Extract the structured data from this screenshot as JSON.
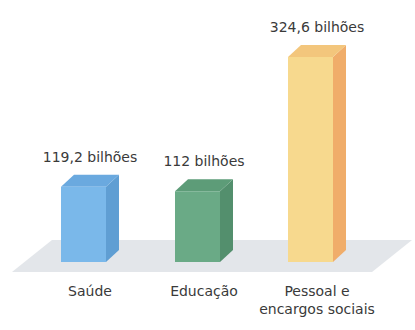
{
  "chart_data": {
    "type": "bar",
    "title": "",
    "categories": [
      "Saúde",
      "Educação",
      "Pessoal e encargos sociais"
    ],
    "category_lines": [
      [
        "Saúde"
      ],
      [
        "Educação"
      ],
      [
        "Pessoal e",
        "encargos sociais"
      ]
    ],
    "values": [
      119.2,
      112,
      324.6
    ],
    "value_labels": [
      "119,2 bilhões",
      "112 bilhões",
      "324,6  bilhões"
    ],
    "unit": "bilhões",
    "xlabel": "",
    "ylabel": "",
    "ylim": [
      0,
      340
    ],
    "grid": false,
    "legend": false,
    "style": "3d",
    "colors": {
      "Saúde": {
        "front": "#7ab8ea",
        "side": "#5f9ed3",
        "top": "#6aa9df"
      },
      "Educação": {
        "front": "#6aaa86",
        "side": "#538f6d",
        "top": "#5d9c78"
      },
      "Pessoal e encargos sociais": {
        "front": "#f7d98e",
        "side": "#f0ad6a",
        "top": "#f3c67c"
      }
    },
    "floor_color": "#e3e6ea"
  }
}
